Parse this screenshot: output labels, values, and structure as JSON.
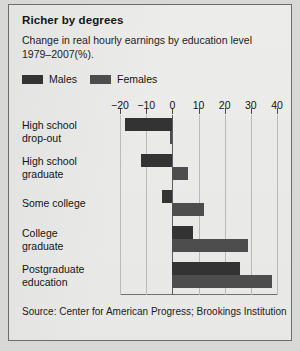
{
  "title": "Richer by degrees",
  "subtitle": "Change in real hourly earnings by education level 1979–2007(%).",
  "legend": {
    "male_label": "Males",
    "female_label": "Females",
    "male_color": "#333333",
    "female_color": "#4d4d4d"
  },
  "source": "Source: Center for American Progress;\nBrookings Institution",
  "chart_data": {
    "type": "bar",
    "orientation": "horizontal",
    "title": "Richer by degrees",
    "subtitle": "Change in real hourly earnings by education level 1979–2007(%).",
    "xlabel": "",
    "ylabel": "",
    "xlim": [
      -20,
      40
    ],
    "ticks": [
      -20,
      -10,
      0,
      10,
      20,
      30,
      40
    ],
    "tick_labels": [
      "−20",
      "−10",
      "0",
      "10",
      "20",
      "30",
      "40"
    ],
    "grid": true,
    "legend_position": "top-left",
    "categories": [
      "High school\ndrop-out",
      "High school\ngraduate",
      "Some college",
      "College\ngraduate",
      "Postgraduate\neducation"
    ],
    "series": [
      {
        "name": "Males",
        "color": "#333333",
        "values": [
          -18,
          -12,
          -4,
          8,
          26
        ]
      },
      {
        "name": "Females",
        "color": "#4d4d4d",
        "values": [
          -1,
          6,
          12,
          29,
          38
        ]
      }
    ],
    "source": "Source: Center for American Progress; Brookings Institution"
  }
}
